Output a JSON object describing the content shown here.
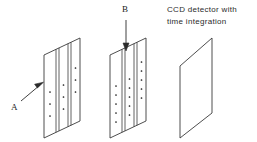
{
  "figure": {
    "title_hidden": "",
    "background_color": "#ffffff",
    "line_color": "#3a3a3a",
    "dot_color": "#1a1a1a",
    "caption": {
      "line1": "CCD detector with",
      "line2": "time    integration"
    },
    "labels": {
      "a": "A",
      "b": "B"
    },
    "panels": [
      {
        "name": "first-grating-panel",
        "columns": 3,
        "dots_per_column": 3,
        "has_stripes": true,
        "has_dots": true
      },
      {
        "name": "second-grating-panel",
        "columns": 3,
        "dots_per_column": 5,
        "has_stripes": true,
        "has_dots": true
      },
      {
        "name": "ccd-detector-panel",
        "columns": 0,
        "dots_per_column": 0,
        "has_stripes": false,
        "has_dots": false
      }
    ],
    "arrows": [
      {
        "name": "arrow-a",
        "direction": "diagonal-up-right"
      },
      {
        "name": "arrow-b",
        "direction": "down"
      }
    ]
  }
}
